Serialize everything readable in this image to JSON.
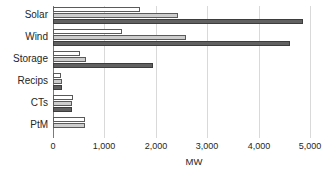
{
  "chart_data": {
    "type": "bar",
    "orientation": "horizontal",
    "title": "",
    "xlabel": "MW",
    "ylabel": "",
    "xlim": [
      0,
      5000
    ],
    "xticks": [
      0,
      1000,
      2000,
      3000,
      4000,
      5000
    ],
    "xticklabels": [
      "0",
      "1,000",
      "2,000",
      "3,000",
      "4,000",
      "5,000"
    ],
    "grid": "vertical",
    "legend": "none",
    "categories": [
      "Solar",
      "Wind",
      "Storage",
      "Recips",
      "CTs",
      "PtM"
    ],
    "series": [
      {
        "name": "Series 1",
        "color": "#ffffff",
        "values": [
          1690,
          1350,
          530,
          165,
          385,
          620
        ]
      },
      {
        "name": "Series 2",
        "color": "#cdcdcd",
        "values": [
          2430,
          2580,
          640,
          175,
          375,
          620
        ]
      },
      {
        "name": "Series 3",
        "color": "#616161",
        "values": [
          4860,
          4620,
          1950,
          180,
          370,
          0
        ]
      }
    ]
  },
  "axis": {
    "grid_color": "#d9d9d9",
    "axis_color": "#7a7a7a",
    "bar_edge_color": "#5a5a5a"
  }
}
